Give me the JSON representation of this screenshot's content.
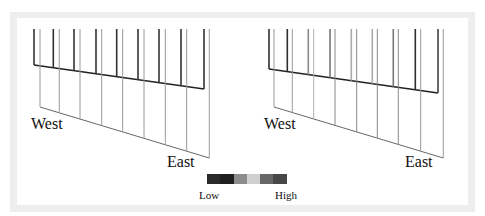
{
  "figure": {
    "panels": [
      {
        "id": "left",
        "west_label": "West",
        "east_label": "East",
        "shades": [
          "#333333",
          "#333333",
          "#333333",
          "#333333",
          "#333333",
          "#333333",
          "#333333",
          "#333333",
          "#333333"
        ],
        "light_shades": [
          "#9a9a9a",
          "#9a9a9a",
          "#9a9a9a",
          "#9a9a9a",
          "#9a9a9a",
          "#9a9a9a",
          "#9a9a9a",
          "#9a9a9a",
          "#9a9a9a"
        ]
      },
      {
        "id": "right",
        "west_label": "West",
        "east_label": "East",
        "shades": [
          "#2e2e2e",
          "#2e2e2e",
          "#8a8a8a",
          "#777777",
          "#aaaaaa",
          "#aaaaaa",
          "#777777",
          "#2e2e2e",
          "#444444"
        ],
        "light_shades": [
          "#9a9a9a",
          "#9a9a9a",
          "#b0b0b0",
          "#888888",
          "#888888",
          "#888888",
          "#888888",
          "#999999",
          "#999999"
        ]
      }
    ],
    "legend": {
      "low_label": "Low",
      "high_label": "High",
      "colors": [
        "#2a2a2a",
        "#1f1f1f",
        "#8c8c8c",
        "#cfcfcf",
        "#676767",
        "#474747"
      ]
    }
  }
}
